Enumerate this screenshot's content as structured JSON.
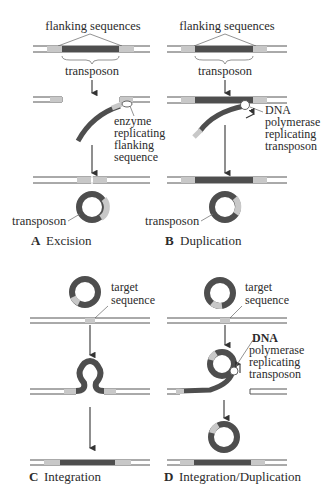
{
  "colors": {
    "transposon": "#4e4e4e",
    "flanking": "#c8c8c8",
    "dna_strand": "#555555",
    "background": "#ffffff",
    "enzyme": "#ffffff"
  },
  "panels": [
    {
      "id": "A",
      "letter": "A",
      "title": "Excision",
      "labels": {
        "flanking": "flanking sequences",
        "transposon_top": "transposon",
        "enzyme_lines": [
          "enzyme",
          "replicating",
          "flanking",
          "sequence"
        ],
        "transposon_circle": "transposon"
      }
    },
    {
      "id": "B",
      "letter": "B",
      "title": "Duplication",
      "labels": {
        "flanking": "flanking sequences",
        "transposon_top": "transposon",
        "polymerase_lines": [
          "DNA",
          "polymerase",
          "replicating",
          "transposon"
        ],
        "transposon_circle": "transposon"
      }
    },
    {
      "id": "C",
      "letter": "C",
      "title": "Integration",
      "labels": {
        "target_lines": [
          "target",
          "sequence"
        ]
      }
    },
    {
      "id": "D",
      "letter": "D",
      "title": "Integration/Duplication",
      "labels": {
        "target_lines": [
          "target",
          "sequence"
        ],
        "polymerase_lines": [
          "DNA",
          "polymerase",
          "replicating",
          "transposon"
        ]
      }
    }
  ]
}
